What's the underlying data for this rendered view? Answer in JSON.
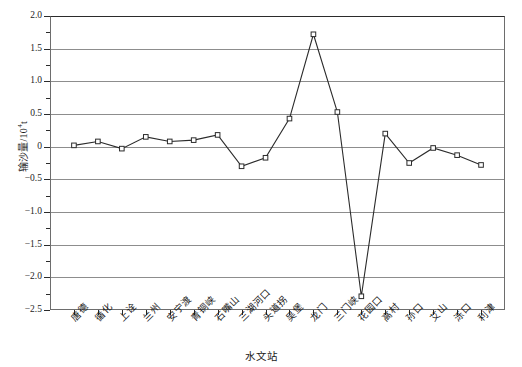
{
  "chart_data": {
    "type": "line",
    "title": "",
    "xlabel": "水文站",
    "ylabel_text": "输沙量/10",
    "ylabel_sup": "4",
    "ylabel_unit_tail": "t",
    "ylim": [
      -2.5,
      2.0
    ],
    "ytick_labels": [
      "2.0",
      "1.5",
      "1.0",
      "0.5",
      "0",
      "−0.5",
      "−1.0",
      "−1.5",
      "−2.0",
      "−2.5"
    ],
    "ytick_values": [
      2.0,
      1.5,
      1.0,
      0.5,
      0,
      -0.5,
      -1.0,
      -1.5,
      -2.0,
      -2.5
    ],
    "grid": true,
    "grid_axis": "y",
    "legend": "none",
    "marker": "open-square",
    "line_color": "#2b2b2b",
    "grid_color": "#8d8d8d",
    "categories": [
      "唐德",
      "循化",
      "上诠",
      "兰州",
      "安宁渡",
      "青铜峡",
      "石嘴山",
      "三湖河口",
      "头道拐",
      "吴堡",
      "龙门",
      "三门峡",
      "花园口",
      "高村",
      "孙口",
      "艾山",
      "泺口",
      "利津"
    ],
    "values": [
      0.02,
      0.08,
      -0.03,
      0.15,
      0.08,
      0.1,
      0.18,
      -0.3,
      -0.17,
      0.43,
      1.72,
      0.53,
      -2.29,
      0.2,
      -0.25,
      -0.02,
      -0.13,
      -0.28
    ]
  }
}
